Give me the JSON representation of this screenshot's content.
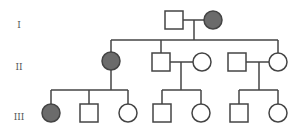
{
  "colors": {
    "affected": "#6b6b6b",
    "unaffected": "#ffffff",
    "line": "#444444"
  },
  "generations": [
    {
      "label": "I",
      "y": 28
    },
    {
      "label": "II",
      "y": 70
    },
    {
      "label": "III",
      "y": 120
    }
  ],
  "individuals": [
    {
      "id": "I-1",
      "sex": "male",
      "affected": false,
      "cx": 174,
      "cy": 20
    },
    {
      "id": "I-2",
      "sex": "female",
      "affected": true,
      "cx": 213,
      "cy": 20
    },
    {
      "id": "II-1",
      "sex": "female",
      "affected": true,
      "cx": 111,
      "cy": 61
    },
    {
      "id": "II-2",
      "sex": "male",
      "affected": false,
      "cx": 161,
      "cy": 62
    },
    {
      "id": "II-3",
      "sex": "female",
      "affected": false,
      "cx": 202,
      "cy": 62
    },
    {
      "id": "II-4",
      "sex": "male",
      "affected": false,
      "cx": 237,
      "cy": 62
    },
    {
      "id": "II-5",
      "sex": "female",
      "affected": false,
      "cx": 278,
      "cy": 62
    },
    {
      "id": "III-1",
      "sex": "female",
      "affected": true,
      "cx": 51,
      "cy": 113
    },
    {
      "id": "III-2",
      "sex": "male",
      "affected": false,
      "cx": 89,
      "cy": 113
    },
    {
      "id": "III-3",
      "sex": "female",
      "affected": false,
      "cx": 128,
      "cy": 113
    },
    {
      "id": "III-4",
      "sex": "male",
      "affected": false,
      "cx": 162,
      "cy": 113
    },
    {
      "id": "III-5",
      "sex": "female",
      "affected": false,
      "cx": 201,
      "cy": 113
    },
    {
      "id": "III-6",
      "sex": "male",
      "affected": false,
      "cx": 239,
      "cy": 113
    },
    {
      "id": "III-7",
      "sex": "female",
      "affected": false,
      "cx": 278,
      "cy": 113
    }
  ],
  "lines": [
    {
      "name": "mating-I",
      "x1": 183,
      "y1": 20,
      "x2": 204,
      "y2": 20
    },
    {
      "name": "descent-I",
      "x1": 194,
      "y1": 20,
      "x2": 194,
      "y2": 40
    },
    {
      "name": "sibship-II",
      "x1": 111,
      "y1": 40,
      "x2": 278,
      "y2": 40
    },
    {
      "name": "drop-II-1",
      "x1": 111,
      "y1": 40,
      "x2": 111,
      "y2": 52
    },
    {
      "name": "drop-II-2",
      "x1": 161,
      "y1": 40,
      "x2": 161,
      "y2": 53
    },
    {
      "name": "drop-II-5",
      "x1": 278,
      "y1": 40,
      "x2": 278,
      "y2": 53
    },
    {
      "name": "descent-II-1",
      "x1": 111,
      "y1": 70,
      "x2": 111,
      "y2": 90
    },
    {
      "name": "sibship-III-a",
      "x1": 51,
      "y1": 90,
      "x2": 128,
      "y2": 90
    },
    {
      "name": "drop-III-1",
      "x1": 51,
      "y1": 90,
      "x2": 51,
      "y2": 104
    },
    {
      "name": "drop-III-2",
      "x1": 89,
      "y1": 90,
      "x2": 89,
      "y2": 104
    },
    {
      "name": "drop-III-3",
      "x1": 128,
      "y1": 90,
      "x2": 128,
      "y2": 104
    },
    {
      "name": "mating-II-2-3",
      "x1": 170,
      "y1": 62,
      "x2": 193,
      "y2": 62
    },
    {
      "name": "descent-II-2-3",
      "x1": 181,
      "y1": 62,
      "x2": 181,
      "y2": 90
    },
    {
      "name": "sibship-III-b",
      "x1": 162,
      "y1": 90,
      "x2": 201,
      "y2": 90
    },
    {
      "name": "drop-III-4",
      "x1": 162,
      "y1": 90,
      "x2": 162,
      "y2": 104
    },
    {
      "name": "drop-III-5",
      "x1": 201,
      "y1": 90,
      "x2": 201,
      "y2": 104
    },
    {
      "name": "mating-II-4-5",
      "x1": 246,
      "y1": 62,
      "x2": 269,
      "y2": 62
    },
    {
      "name": "descent-II-4-5",
      "x1": 259,
      "y1": 62,
      "x2": 259,
      "y2": 90
    },
    {
      "name": "sibship-III-c",
      "x1": 239,
      "y1": 90,
      "x2": 278,
      "y2": 90
    },
    {
      "name": "drop-III-6",
      "x1": 239,
      "y1": 90,
      "x2": 239,
      "y2": 104
    },
    {
      "name": "drop-III-7",
      "x1": 278,
      "y1": 90,
      "x2": 278,
      "y2": 104
    }
  ]
}
